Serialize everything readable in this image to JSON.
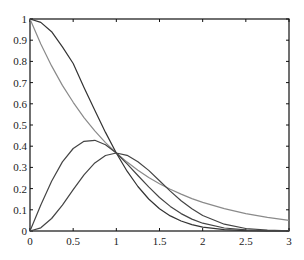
{
  "chart_data": {
    "type": "line",
    "title": "",
    "xlabel": "",
    "ylabel": "",
    "xlim": [
      0,
      3
    ],
    "ylim": [
      0,
      1
    ],
    "grid": false,
    "legend": null,
    "x_ticks": [
      "0",
      "0.5",
      "1",
      "1.5",
      "2",
      "2.5",
      "3"
    ],
    "y_ticks": [
      "0",
      "0.1",
      "0.2",
      "0.3",
      "0.4",
      "0.5",
      "0.6",
      "0.7",
      "0.8",
      "0.9",
      "1"
    ],
    "x": [
      0,
      0.125,
      0.25,
      0.375,
      0.5,
      0.625,
      0.75,
      0.875,
      1.0,
      1.125,
      1.25,
      1.375,
      1.5,
      1.625,
      1.75,
      1.875,
      2.0,
      2.25,
      2.5,
      2.75,
      3.0
    ],
    "series": [
      {
        "name": "decay-gray",
        "color": "#8a8a8a",
        "values": [
          1.0,
          0.882,
          0.779,
          0.687,
          0.607,
          0.535,
          0.472,
          0.417,
          0.368,
          0.325,
          0.287,
          0.253,
          0.223,
          0.197,
          0.174,
          0.153,
          0.135,
          0.105,
          0.082,
          0.064,
          0.05
        ]
      },
      {
        "name": "decay-dark",
        "color": "#333333",
        "values": [
          1.0,
          0.984,
          0.94,
          0.869,
          0.79,
          0.677,
          0.57,
          0.465,
          0.368,
          0.282,
          0.21,
          0.151,
          0.105,
          0.071,
          0.047,
          0.03,
          0.018,
          0.006,
          0.002,
          0.001,
          0.0
        ]
      },
      {
        "name": "rise-early",
        "color": "#444444",
        "values": [
          0.0,
          0.123,
          0.235,
          0.326,
          0.389,
          0.423,
          0.428,
          0.407,
          0.368,
          0.317,
          0.262,
          0.208,
          0.158,
          0.116,
          0.082,
          0.056,
          0.037,
          0.014,
          0.005,
          0.001,
          0.0
        ]
      },
      {
        "name": "rise-late",
        "color": "#444444",
        "values": [
          0.0,
          0.015,
          0.059,
          0.122,
          0.195,
          0.265,
          0.321,
          0.356,
          0.368,
          0.357,
          0.327,
          0.286,
          0.237,
          0.188,
          0.143,
          0.105,
          0.073,
          0.032,
          0.012,
          0.004,
          0.001
        ]
      }
    ]
  }
}
